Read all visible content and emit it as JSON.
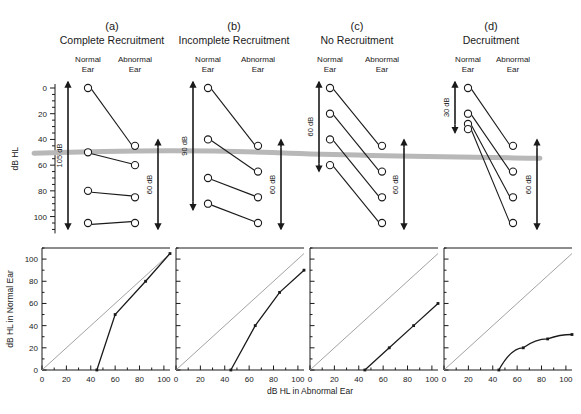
{
  "figure": {
    "top_axis_title": "dB HL",
    "bottom_y_title": "dB HL in Normal Ear",
    "bottom_x_title": "dB HL in Abnormal Ear",
    "normal_ear_label_line1": "Normal",
    "normal_ear_label_line2": "Ear",
    "abnormal_ear_label_line1": "Abnormal",
    "abnormal_ear_label_line2": "Ear",
    "colors": {
      "ink": "#1a1a1a",
      "gray_band": "#b8b8b8",
      "diagonal": "#8a8a8a"
    }
  },
  "chart_data": [
    {
      "type": "line",
      "panel": "a",
      "letter": "(a)",
      "title": "Complete Recruitment",
      "xlabel": "",
      "ylabel": "dB HL",
      "ylim": [
        0,
        110
      ],
      "y_ticks": [
        0,
        20,
        40,
        60,
        80,
        100
      ],
      "grid": false,
      "normal_ear": [
        0,
        50,
        80,
        105
      ],
      "abnormal_ear": [
        45,
        60,
        85,
        105
      ],
      "left_arrow_label": "105 dB",
      "left_arrow_range": [
        0,
        105
      ],
      "right_arrow_label": "60 dB",
      "right_arrow_range": [
        45,
        105
      ]
    },
    {
      "type": "line",
      "panel": "b",
      "letter": "(b)",
      "title": "Incomplete Recruitment",
      "xlabel": "",
      "ylabel": "",
      "ylim": [
        0,
        110
      ],
      "y_ticks": [
        0,
        20,
        40,
        60,
        80,
        100
      ],
      "grid": false,
      "normal_ear": [
        0,
        40,
        70,
        90
      ],
      "abnormal_ear": [
        45,
        65,
        85,
        105
      ],
      "left_arrow_label": "90 dB",
      "left_arrow_range": [
        0,
        90
      ],
      "right_arrow_label": "60 dB",
      "right_arrow_range": [
        45,
        105
      ]
    },
    {
      "type": "line",
      "panel": "c",
      "letter": "(c)",
      "title": "No Recruitment",
      "xlabel": "",
      "ylabel": "",
      "ylim": [
        0,
        110
      ],
      "y_ticks": [
        0,
        20,
        40,
        60,
        80,
        100
      ],
      "grid": false,
      "normal_ear": [
        0,
        20,
        40,
        60
      ],
      "abnormal_ear": [
        45,
        65,
        85,
        105
      ],
      "left_arrow_label": "60 dB",
      "left_arrow_range": [
        0,
        60
      ],
      "right_arrow_label": "60 dB",
      "right_arrow_range": [
        45,
        105
      ]
    },
    {
      "type": "line",
      "panel": "d",
      "letter": "(d)",
      "title": "Decruitment",
      "xlabel": "",
      "ylabel": "",
      "ylim": [
        0,
        110
      ],
      "y_ticks": [
        0,
        20,
        40,
        60,
        80,
        100
      ],
      "grid": false,
      "normal_ear": [
        0,
        20,
        28,
        32
      ],
      "abnormal_ear": [
        45,
        65,
        85,
        105
      ],
      "left_arrow_label": "30 dB",
      "left_arrow_range": [
        0,
        30
      ],
      "right_arrow_label": "60 dB",
      "right_arrow_range": [
        45,
        105
      ]
    },
    {
      "type": "line",
      "panel": "a-bottom",
      "title": "",
      "xlabel": "dB HL in Abnormal Ear",
      "ylabel": "dB HL in Normal Ear",
      "xlim": [
        0,
        105
      ],
      "ylim": [
        0,
        110
      ],
      "x_ticks": [
        0,
        20,
        40,
        60,
        80,
        100
      ],
      "y_ticks": [
        0,
        20,
        40,
        60,
        80,
        100
      ],
      "grid": false,
      "x": [
        45,
        60,
        85,
        105
      ],
      "y": [
        0,
        50,
        80,
        105
      ],
      "reference_line": "identity"
    },
    {
      "type": "line",
      "panel": "b-bottom",
      "title": "",
      "xlabel": "",
      "ylabel": "",
      "xlim": [
        0,
        105
      ],
      "ylim": [
        0,
        110
      ],
      "x_ticks": [
        0,
        20,
        40,
        60,
        80,
        100
      ],
      "y_ticks": [
        0,
        20,
        40,
        60,
        80,
        100
      ],
      "grid": false,
      "x": [
        45,
        65,
        85,
        105
      ],
      "y": [
        0,
        40,
        70,
        90
      ],
      "reference_line": "identity"
    },
    {
      "type": "line",
      "panel": "c-bottom",
      "title": "",
      "xlabel": "",
      "ylabel": "",
      "xlim": [
        0,
        105
      ],
      "ylim": [
        0,
        110
      ],
      "x_ticks": [
        0,
        20,
        40,
        60,
        80,
        100
      ],
      "y_ticks": [
        0,
        20,
        40,
        60,
        80,
        100
      ],
      "grid": false,
      "x": [
        45,
        65,
        85,
        105
      ],
      "y": [
        0,
        20,
        40,
        60
      ],
      "reference_line": "identity"
    },
    {
      "type": "line",
      "panel": "d-bottom",
      "title": "",
      "xlabel": "",
      "ylabel": "",
      "xlim": [
        0,
        105
      ],
      "ylim": [
        0,
        110
      ],
      "x_ticks": [
        0,
        20,
        40,
        60,
        80,
        100
      ],
      "y_ticks": [
        0,
        20,
        40,
        60,
        80,
        100
      ],
      "grid": false,
      "x": [
        45,
        65,
        85,
        105
      ],
      "y": [
        0,
        20,
        28,
        32
      ],
      "reference_line": "identity"
    }
  ]
}
